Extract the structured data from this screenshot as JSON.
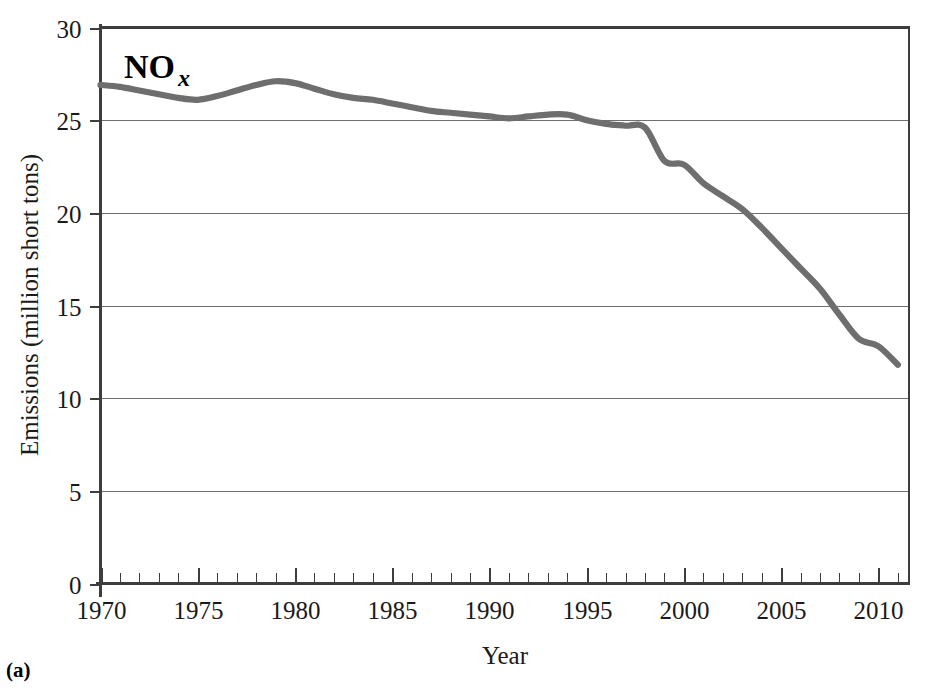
{
  "figure": {
    "panel_caption": "(a)",
    "series_label_main": "NO",
    "series_label_sub": "x"
  },
  "chart_data": {
    "type": "line",
    "title": "",
    "series_name": "NOx",
    "xlabel": "Year",
    "ylabel": "Emissions (million short tons)",
    "xlim": [
      1970,
      2011.6
    ],
    "ylim": [
      0,
      30
    ],
    "grid": "horizontal",
    "legend_position": "none",
    "line_color": "#6e6e6e",
    "axis_color": "#4a4a4a",
    "grid_color": "#6f6f6f",
    "xticks_major": [
      1970,
      1975,
      1980,
      1985,
      1990,
      1995,
      2000,
      2005,
      2010
    ],
    "xtick_labels": [
      "1970",
      "1975",
      "1980",
      "1985",
      "1990",
      "1995",
      "2000",
      "2005",
      "2010"
    ],
    "xtick_minor_step": 1,
    "yticks": [
      0,
      5,
      10,
      15,
      20,
      25,
      30
    ],
    "ytick_labels": [
      "0",
      "5",
      "10",
      "15",
      "20",
      "25",
      "30"
    ],
    "x": [
      1970,
      1971,
      1972,
      1973,
      1974,
      1975,
      1976,
      1977,
      1978,
      1979,
      1980,
      1981,
      1982,
      1983,
      1984,
      1985,
      1986,
      1987,
      1988,
      1989,
      1990,
      1991,
      1992,
      1993,
      1994,
      1995,
      1996,
      1997,
      1998,
      1999,
      2000,
      2001,
      2002,
      2003,
      2004,
      2005,
      2006,
      2007,
      2008,
      2009,
      2010,
      2011
    ],
    "values": [
      26.9,
      26.8,
      26.6,
      26.4,
      26.2,
      26.1,
      26.3,
      26.6,
      26.9,
      27.1,
      27.0,
      26.7,
      26.4,
      26.2,
      26.1,
      25.9,
      25.7,
      25.5,
      25.4,
      25.3,
      25.2,
      25.1,
      25.2,
      25.3,
      25.3,
      25.0,
      24.8,
      24.7,
      24.6,
      22.8,
      22.6,
      21.6,
      20.9,
      20.2,
      19.2,
      18.1,
      17.0,
      15.9,
      14.5,
      13.2,
      12.8,
      11.8
    ],
    "annotations": [
      {
        "text": "NOx",
        "x": 1973,
        "y": 28.6
      }
    ]
  }
}
